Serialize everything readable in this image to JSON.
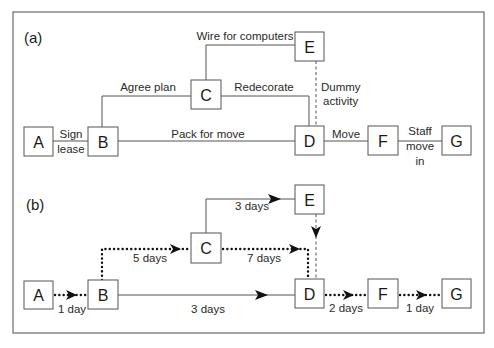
{
  "panels": {
    "a": {
      "label": "(a)",
      "nodes": [
        {
          "id": "A",
          "label": "A"
        },
        {
          "id": "B",
          "label": "B"
        },
        {
          "id": "C",
          "label": "C"
        },
        {
          "id": "D",
          "label": "D"
        },
        {
          "id": "E",
          "label": "E"
        },
        {
          "id": "F",
          "label": "F"
        },
        {
          "id": "G",
          "label": "G"
        }
      ],
      "activities": {
        "sign_lease_1": "Sign",
        "sign_lease_2": "lease",
        "agree_plan": "Agree plan",
        "pack_for_move": "Pack for move",
        "wire_for_computers": "Wire for computers",
        "redecorate": "Redecorate",
        "dummy_1": "Dummy",
        "dummy_2": "activity",
        "move": "Move",
        "staff_move_in_1": "Staff",
        "staff_move_in_2": "move",
        "staff_move_in_3": "in"
      },
      "edges": [
        {
          "from": "A",
          "to": "B",
          "activity": "Sign lease",
          "style": "solid"
        },
        {
          "from": "B",
          "to": "C",
          "activity": "Agree plan",
          "style": "solid"
        },
        {
          "from": "B",
          "to": "D",
          "activity": "Pack for move",
          "style": "solid"
        },
        {
          "from": "C",
          "to": "E",
          "activity": "Wire for computers",
          "style": "solid"
        },
        {
          "from": "C",
          "to": "D",
          "activity": "Redecorate",
          "style": "solid"
        },
        {
          "from": "E",
          "to": "D",
          "activity": "Dummy activity",
          "style": "dashed"
        },
        {
          "from": "D",
          "to": "F",
          "activity": "Move",
          "style": "solid"
        },
        {
          "from": "F",
          "to": "G",
          "activity": "Staff move in",
          "style": "solid"
        }
      ]
    },
    "b": {
      "label": "(b)",
      "nodes": [
        {
          "id": "A",
          "label": "A"
        },
        {
          "id": "B",
          "label": "B"
        },
        {
          "id": "C",
          "label": "C"
        },
        {
          "id": "D",
          "label": "D"
        },
        {
          "id": "E",
          "label": "E"
        },
        {
          "id": "F",
          "label": "F"
        },
        {
          "id": "G",
          "label": "G"
        }
      ],
      "durations": {
        "a_b": "1 day",
        "b_c": "5 days",
        "b_d": "3 days",
        "c_e": "3 days",
        "c_d": "7 days",
        "d_f": "2 days",
        "f_g": "1 day"
      },
      "edges": [
        {
          "from": "A",
          "to": "B",
          "duration": "1 day",
          "critical": true
        },
        {
          "from": "B",
          "to": "C",
          "duration": "5 days",
          "critical": true
        },
        {
          "from": "B",
          "to": "D",
          "duration": "3 days",
          "critical": false
        },
        {
          "from": "C",
          "to": "E",
          "duration": "3 days",
          "critical": false
        },
        {
          "from": "C",
          "to": "D",
          "duration": "7 days",
          "critical": true
        },
        {
          "from": "E",
          "to": "D",
          "duration": "",
          "critical": false,
          "dummy": true
        },
        {
          "from": "D",
          "to": "F",
          "duration": "2 days",
          "critical": true
        },
        {
          "from": "F",
          "to": "G",
          "duration": "1 day",
          "critical": true
        }
      ]
    }
  }
}
